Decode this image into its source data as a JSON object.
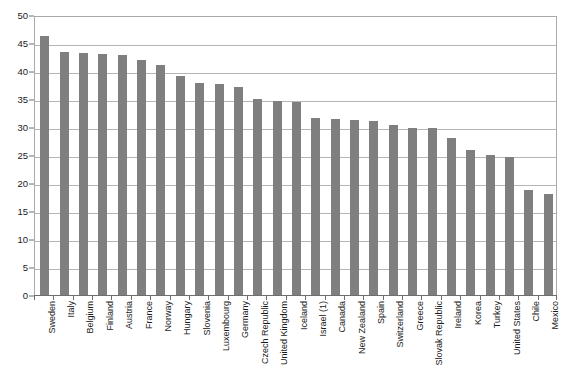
{
  "chart_data": {
    "type": "bar",
    "title": "",
    "subtitle": "",
    "xlabel": "",
    "ylabel": "",
    "ylim": [
      0,
      50
    ],
    "ytick_step": 5,
    "yticks": [
      0,
      5,
      10,
      15,
      20,
      25,
      30,
      35,
      40,
      45,
      50
    ],
    "ytick_labels": [
      "0",
      "5",
      "10",
      "15",
      "20",
      "25",
      "30",
      "35",
      "40",
      "45",
      "50"
    ],
    "grid": true,
    "grid_axis": "y",
    "legend": false,
    "legend_position": "none",
    "bar_color": "#7f7f7f",
    "gridline_color": "#b5b5b5",
    "frame_color": "#a9a9a9",
    "axis_color": "#6e6e6e",
    "background_color": "#ffffff",
    "label_rotation": -90,
    "categories": [
      "Sweden",
      "Italy",
      "Belgium",
      "Finland",
      "Austria",
      "France",
      "Norway",
      "Hungary",
      "Slovenia",
      "Luxembourg",
      "Germany",
      "Czech Republic",
      "United Kingdom",
      "Iceland",
      "Israel (1)",
      "Canada",
      "New Zealand",
      "Spain",
      "Switzerland",
      "Greece",
      "Slovak Republic",
      "Ireland",
      "Korea",
      "Turkey",
      "United States",
      "Chile",
      "Mexico"
    ],
    "values": [
      46.2,
      43.4,
      43.2,
      43.1,
      42.8,
      41.9,
      41.0,
      39.1,
      37.8,
      37.6,
      37.1,
      35.0,
      34.7,
      34.4,
      31.6,
      31.4,
      31.3,
      31.0,
      30.3,
      29.9,
      29.9,
      28.1,
      25.9,
      25.0,
      24.6,
      18.7,
      18.1
    ]
  }
}
